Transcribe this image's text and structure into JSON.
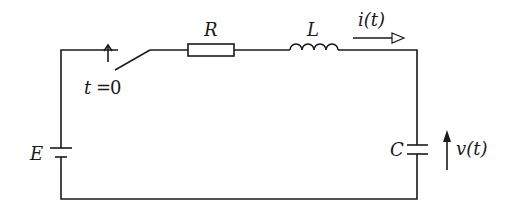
{
  "diagram": {
    "type": "circuit",
    "components": {
      "source": {
        "label": "E",
        "kind": "dc-voltage-source"
      },
      "switch": {
        "label_var": "t",
        "label_eq": "=",
        "label_val": "0",
        "kind": "switch-closes-at-t0"
      },
      "resistor": {
        "label": "R"
      },
      "inductor": {
        "label": "L"
      },
      "capacitor": {
        "label": "C"
      }
    },
    "annotations": {
      "current": {
        "var": "i",
        "arg": "t",
        "text": "i(t)"
      },
      "voltage": {
        "var": "v",
        "arg": "t",
        "text": "v(t)"
      }
    },
    "colors": {
      "ink": "#1a1a1a",
      "background": "#ffffff"
    }
  }
}
